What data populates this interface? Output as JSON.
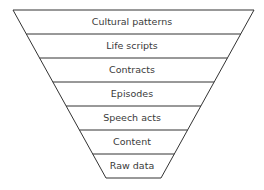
{
  "diagram": {
    "type": "inverted-pyramid",
    "line_color": "#333333",
    "text_color": "#3a3a3a",
    "layers": [
      {
        "label": "Cultural patterns"
      },
      {
        "label": "Life scripts"
      },
      {
        "label": "Contracts"
      },
      {
        "label": "Episodes"
      },
      {
        "label": "Speech acts"
      },
      {
        "label": "Content"
      },
      {
        "label": "Raw data"
      }
    ]
  }
}
